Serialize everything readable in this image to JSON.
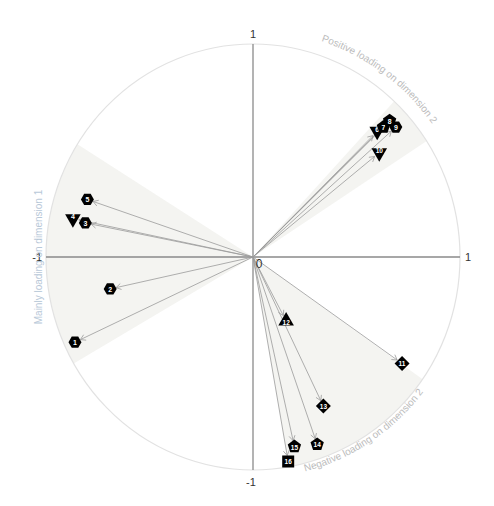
{
  "chart_data": {
    "type": "scatter",
    "subtype": "correlation-circle",
    "title": "",
    "xlabel": "",
    "ylabel": "",
    "xlim": [
      -1,
      1
    ],
    "ylim": [
      -1,
      1
    ],
    "grid": false,
    "legend": null,
    "axis_ticks": {
      "x": [
        "-1",
        "0",
        "1"
      ],
      "y": [
        "-1",
        "0",
        "1"
      ]
    },
    "center_label": "0",
    "tick_labels": {
      "top": "1",
      "bottom": "-1",
      "left": "-1",
      "right": "1",
      "origin": "0"
    },
    "annotations": [
      {
        "text": "Mainly loading on dimension 1",
        "position": "left",
        "color": "#b8c8d8"
      },
      {
        "text": "Positive loading on dimension 2",
        "position": "upper-right",
        "color": "#bcbcbc"
      },
      {
        "text": "Negative loading on dimension 2",
        "position": "lower-right",
        "color": "#bcbcbc"
      }
    ],
    "shaded_sectors": [
      {
        "name": "dimension-1-sector",
        "start_deg": 148,
        "end_deg": 210
      },
      {
        "name": "positive-dim2-sector",
        "start_deg": 33,
        "end_deg": 47
      },
      {
        "name": "negative-dim2-sector",
        "start_deg": 280,
        "end_deg": 325
      }
    ],
    "points": [
      {
        "label": "1",
        "x": -0.86,
        "y": -0.4,
        "marker": "hexagon"
      },
      {
        "label": "2",
        "x": -0.69,
        "y": -0.15,
        "marker": "hexagon"
      },
      {
        "label": "3",
        "x": -0.81,
        "y": 0.16,
        "marker": "hexagon"
      },
      {
        "label": "4",
        "x": -0.87,
        "y": 0.18,
        "marker": "triangle-down"
      },
      {
        "label": "5",
        "x": -0.8,
        "y": 0.27,
        "marker": "hexagon"
      },
      {
        "label": "6",
        "x": 0.6,
        "y": 0.59,
        "marker": "triangle-down"
      },
      {
        "label": "7",
        "x": 0.63,
        "y": 0.61,
        "marker": "pentagon"
      },
      {
        "label": "8",
        "x": 0.66,
        "y": 0.64,
        "marker": "pentagon"
      },
      {
        "label": "9",
        "x": 0.69,
        "y": 0.61,
        "marker": "hexagon"
      },
      {
        "label": "10",
        "x": 0.61,
        "y": 0.49,
        "marker": "triangle-down"
      },
      {
        "label": "11",
        "x": 0.72,
        "y": -0.5,
        "marker": "diamond"
      },
      {
        "label": "12",
        "x": 0.16,
        "y": -0.3,
        "marker": "triangle-up"
      },
      {
        "label": "13",
        "x": 0.34,
        "y": -0.7,
        "marker": "diamond"
      },
      {
        "label": "14",
        "x": 0.31,
        "y": -0.88,
        "marker": "pentagon"
      },
      {
        "label": "15",
        "x": 0.2,
        "y": -0.89,
        "marker": "pentagon"
      },
      {
        "label": "16",
        "x": 0.17,
        "y": -0.96,
        "marker": "square"
      }
    ]
  },
  "colors": {
    "circle": "#e2e2e2",
    "axis": "#8a8a8a",
    "arrow": "#9a9a9a",
    "marker": "#000000",
    "marker_text": "#ffffff",
    "sector_fill": "#f4f4f1",
    "label_text": "#c4c4c4",
    "tick_text": "#333333"
  }
}
